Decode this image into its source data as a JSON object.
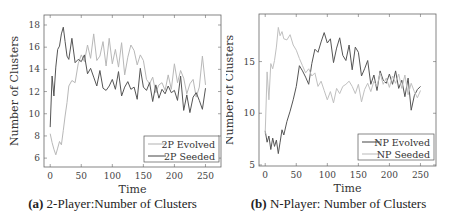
{
  "chart_data": [
    {
      "type": "line",
      "panel": "a",
      "title": "2-Player:Number of Clusters",
      "caption_label": "(a)",
      "caption_text": " 2-Player:Number of Clusters",
      "xlabel": "Time",
      "ylabel": "Number of Clusters",
      "xlim": [
        -10,
        275
      ],
      "ylim": [
        5.2,
        18.9
      ],
      "xticks": [
        0,
        50,
        100,
        150,
        200,
        250
      ],
      "yticks": [
        6,
        8,
        10,
        12,
        14,
        16,
        18
      ],
      "grid": false,
      "legend_position": "lower right",
      "series": [
        {
          "name": "2P Evolved",
          "color": "#b8b8b8",
          "x": [
            0,
            3,
            6,
            9,
            12,
            15,
            18,
            21,
            24,
            27,
            30,
            35,
            40,
            45,
            50,
            55,
            60,
            65,
            70,
            75,
            80,
            85,
            90,
            95,
            100,
            105,
            110,
            115,
            120,
            125,
            130,
            135,
            140,
            145,
            150,
            155,
            160,
            165,
            170,
            175,
            180,
            185,
            190,
            195,
            200,
            205,
            210,
            215,
            220,
            225,
            230,
            235,
            240,
            245,
            250
          ],
          "values": [
            8.2,
            7.4,
            6.8,
            6.3,
            6.9,
            7.5,
            7.2,
            8.5,
            9.8,
            11.0,
            12.5,
            13.0,
            12.8,
            14.5,
            15.3,
            14.7,
            16.2,
            15.0,
            17.2,
            14.8,
            15.2,
            16.5,
            14.3,
            16.8,
            14.5,
            15.8,
            14.2,
            16.4,
            13.5,
            15.1,
            16.2,
            15.7,
            14.4,
            15.3,
            14.8,
            13.1,
            12.7,
            13.3,
            11.9,
            12.6,
            12.8,
            12.1,
            13.5,
            12.2,
            14.5,
            12.8,
            13.9,
            13.2,
            11.8,
            12.7,
            13.1,
            11.5,
            12.4,
            15.2,
            12.6
          ]
        },
        {
          "name": "2P Seeded",
          "color": "#555555",
          "x": [
            0,
            3,
            6,
            9,
            12,
            15,
            18,
            21,
            24,
            27,
            30,
            35,
            40,
            45,
            50,
            55,
            60,
            65,
            70,
            75,
            80,
            85,
            90,
            95,
            100,
            105,
            110,
            115,
            120,
            125,
            130,
            135,
            140,
            145,
            150,
            155,
            160,
            165,
            170,
            175,
            180,
            185,
            190,
            195,
            200,
            205,
            210,
            215,
            220,
            225,
            230,
            235,
            240,
            245,
            250
          ],
          "values": [
            8.8,
            13.4,
            11.6,
            14.2,
            15.8,
            16.1,
            17.2,
            17.8,
            16.5,
            15.2,
            14.9,
            16.8,
            14.6,
            14.9,
            14.7,
            15.3,
            13.6,
            14.1,
            13.3,
            12.5,
            13.9,
            12.3,
            12.1,
            12.5,
            13.1,
            12.2,
            13.8,
            11.6,
            12.4,
            12.9,
            12.2,
            12.4,
            11.3,
            14.1,
            12.4,
            12.1,
            12.8,
            11.1,
            12.6,
            11.4,
            12.2,
            11.8,
            12.5,
            11.9,
            12.1,
            11.2,
            13.4,
            10.3,
            11.7,
            10.1,
            11.5,
            11.9,
            11.2,
            10.4,
            12.3
          ]
        }
      ]
    },
    {
      "type": "line",
      "panel": "b",
      "title": "N-Player: Number of Clusters",
      "caption_label": "(b)",
      "caption_text": " N-Player: Number of Clusters",
      "xlabel": "Time",
      "ylabel": "Number of Clusters",
      "xlim": [
        -10,
        275
      ],
      "ylim": [
        4.9,
        19.6
      ],
      "xticks": [
        0,
        50,
        100,
        150,
        200,
        250
      ],
      "yticks": [
        5,
        10,
        15
      ],
      "grid": false,
      "legend_position": "lower right",
      "series": [
        {
          "name": "NP Evolved",
          "color": "#555555",
          "x": [
            0,
            3,
            6,
            9,
            12,
            15,
            18,
            21,
            24,
            27,
            30,
            35,
            40,
            45,
            50,
            55,
            60,
            65,
            70,
            75,
            80,
            85,
            90,
            95,
            100,
            105,
            110,
            115,
            120,
            125,
            130,
            135,
            140,
            145,
            150,
            155,
            160,
            165,
            170,
            175,
            180,
            185,
            190,
            195,
            200,
            205,
            210,
            215,
            220,
            225,
            230,
            235,
            240,
            245,
            250
          ],
          "values": [
            8.3,
            7.2,
            7.8,
            6.5,
            7.6,
            6.8,
            7.4,
            6.1,
            7.2,
            8.4,
            7.9,
            9.2,
            10.2,
            11.3,
            12.6,
            14.6,
            14.1,
            13.5,
            12.8,
            14.8,
            16.2,
            15.9,
            16.9,
            17.8,
            16.8,
            17.2,
            14.9,
            16.3,
            17.3,
            15.6,
            15.1,
            16.6,
            14.2,
            16.4,
            15.9,
            13.6,
            14.3,
            15.1,
            12.8,
            13.7,
            12.2,
            14.1,
            13.2,
            12.9,
            13.8,
            12.8,
            14.1,
            12.4,
            13.2,
            11.6,
            13.4,
            10.3,
            11.7,
            12.3,
            12.6
          ]
        },
        {
          "name": "NP Seeded",
          "color": "#c0c0c0",
          "x": [
            0,
            3,
            6,
            9,
            12,
            15,
            18,
            21,
            24,
            27,
            30,
            35,
            40,
            45,
            50,
            55,
            60,
            65,
            70,
            75,
            80,
            85,
            90,
            95,
            100,
            105,
            110,
            115,
            120,
            125,
            130,
            135,
            140,
            145,
            150,
            155,
            160,
            165,
            170,
            175,
            180,
            185,
            190,
            195,
            200,
            205,
            210,
            215,
            220,
            225,
            230,
            235,
            240,
            245,
            250
          ],
          "values": [
            8.0,
            14.0,
            11.3,
            14.8,
            14.3,
            15.1,
            16.4,
            18.3,
            17.5,
            17.9,
            17.2,
            17.1,
            17.6,
            16.6,
            16.1,
            15.3,
            14.6,
            13.9,
            14.3,
            13.6,
            13.9,
            12.6,
            13.1,
            12.2,
            11.3,
            12.1,
            11.0,
            12.4,
            11.9,
            12.6,
            12.8,
            13.1,
            12.6,
            11.9,
            12.8,
            11.1,
            12.3,
            12.9,
            12.1,
            13.1,
            12.6,
            13.9,
            12.8,
            13.4,
            12.5,
            13.6,
            12.9,
            13.8,
            12.4,
            13.7,
            11.8,
            12.9,
            12.1,
            11.5,
            12.2
          ]
        }
      ]
    }
  ],
  "panels": {
    "a": {
      "xlabel": "Time",
      "ylabel": "Number of Clusters",
      "caption_label": "(a)",
      "caption_text": " 2-Player:Number of Clusters",
      "legend": [
        "2P Evolved",
        "2P Seeded"
      ]
    },
    "b": {
      "xlabel": "Time",
      "ylabel": "Number of Clusters",
      "caption_label": "(b)",
      "caption_text": " N-Player: Number of Clusters",
      "legend": [
        "NP Evolved",
        "NP Seeded"
      ]
    }
  }
}
